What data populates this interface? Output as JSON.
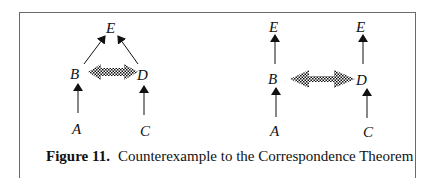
{
  "figure": {
    "number_label": "Figure 11.",
    "caption": "Counterexample to the Correspondence Theorem"
  },
  "diagrams": {
    "left": {
      "nodes": {
        "E": "E",
        "B": "B",
        "D": "D",
        "A": "A",
        "C": "C"
      },
      "edges": [
        "A→B",
        "C→D",
        "B→E",
        "D→E"
      ],
      "correspondence": "B⇔D (checkered double arrow)"
    },
    "right": {
      "nodes": {
        "E1": "E",
        "E2": "E",
        "B": "B",
        "D": "D",
        "A": "A",
        "C": "C"
      },
      "edges": [
        "A→B",
        "B→E",
        "C→D",
        "D→E"
      ],
      "correspondence": "B⇔D (checkered double arrow)"
    }
  },
  "colors": {
    "ink": "#111111",
    "frame": "#6a6a6a"
  }
}
